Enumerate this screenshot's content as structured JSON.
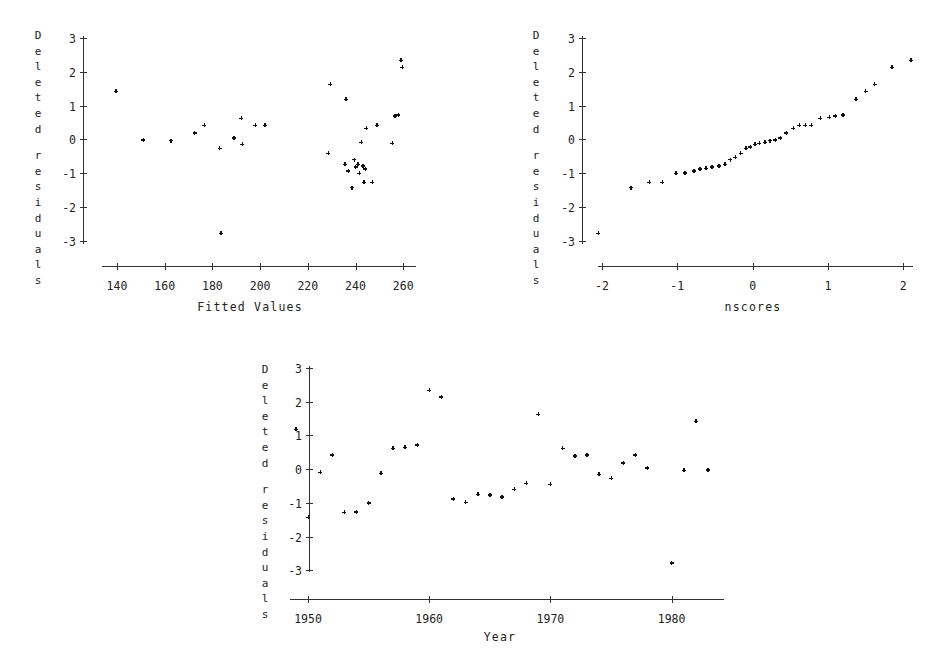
{
  "figure": {
    "title": "",
    "background": "#ffffff",
    "ink": "#111111"
  },
  "chart_data": [
    {
      "id": "fitted-values-plot",
      "type": "scatter",
      "title": "",
      "xlabel": "Fitted Values",
      "ylabel": "Deleted residuals",
      "ylabel_stacked": [
        "D",
        "e",
        "l",
        "e",
        "t",
        "e",
        "d",
        "",
        "r",
        "e",
        "s",
        "i",
        "d",
        "u",
        "a",
        "l",
        "s"
      ],
      "xlim": [
        130,
        268
      ],
      "ylim": [
        -3.4,
        3.2
      ],
      "xticks": [
        140,
        160,
        180,
        200,
        220,
        240,
        260
      ],
      "xticklabels": [
        "140",
        "160",
        "180",
        "200",
        "220",
        "240",
        "260"
      ],
      "yticks": [
        3,
        2,
        1,
        0,
        -1,
        -2,
        -3
      ],
      "yticklabels": [
        "3",
        "2",
        "1",
        "0",
        "-1",
        "-2",
        "-3"
      ],
      "grid": false,
      "legend": "none",
      "marker": "plus",
      "points": [
        [
          139.5,
          1.42
        ],
        [
          151.0,
          -0.02
        ],
        [
          162.5,
          -0.04
        ],
        [
          172.5,
          0.19
        ],
        [
          176.5,
          0.42
        ],
        [
          183.0,
          -0.27
        ],
        [
          183.5,
          -2.78
        ],
        [
          189.0,
          0.04
        ],
        [
          192.5,
          -0.15
        ],
        [
          192.0,
          0.62
        ],
        [
          198.0,
          0.42
        ],
        [
          202.0,
          0.41
        ],
        [
          229.5,
          1.63
        ],
        [
          228.5,
          -0.42
        ],
        [
          236.0,
          1.18
        ],
        [
          235.5,
          -0.74
        ],
        [
          237.0,
          -0.93
        ],
        [
          238.5,
          -1.43
        ],
        [
          239.5,
          -0.6
        ],
        [
          240.0,
          -0.82
        ],
        [
          241.0,
          -0.74
        ],
        [
          241.5,
          -1.0
        ],
        [
          242.5,
          -0.09
        ],
        [
          243.0,
          -0.79
        ],
        [
          243.5,
          -1.28
        ],
        [
          244.0,
          -0.88
        ],
        [
          244.5,
          0.32
        ],
        [
          247.0,
          -1.27
        ],
        [
          249.0,
          0.42
        ],
        [
          255.5,
          -0.12
        ],
        [
          256.5,
          0.69
        ],
        [
          258.0,
          0.72
        ],
        [
          259.0,
          2.34
        ],
        [
          259.5,
          2.14
        ]
      ]
    },
    {
      "id": "nscores-plot",
      "type": "scatter",
      "title": "",
      "xlabel": "nscores",
      "ylabel": "Deleted residuals",
      "ylabel_stacked": [
        "D",
        "e",
        "l",
        "e",
        "t",
        "e",
        "d",
        "",
        "r",
        "e",
        "s",
        "i",
        "d",
        "u",
        "a",
        "l",
        "s"
      ],
      "xlim": [
        -2.25,
        2.3
      ],
      "ylim": [
        -3.4,
        3.2
      ],
      "xticks": [
        -2,
        -1,
        0,
        1,
        2
      ],
      "xticklabels": [
        "-2",
        "-1",
        "0",
        "1",
        "2"
      ],
      "yticks": [
        3,
        2,
        1,
        0,
        -1,
        -2,
        -3
      ],
      "yticklabels": [
        "3",
        "2",
        "1",
        "0",
        "-1",
        "-2",
        "-3"
      ],
      "grid": false,
      "legend": "none",
      "marker": "plus",
      "points": [
        [
          -2.05,
          -2.78
        ],
        [
          -1.62,
          -1.43
        ],
        [
          -1.37,
          -1.28
        ],
        [
          -1.2,
          -1.27
        ],
        [
          -1.02,
          -1.0
        ],
        [
          -0.9,
          -0.99
        ],
        [
          -0.78,
          -0.93
        ],
        [
          -0.7,
          -0.88
        ],
        [
          -0.62,
          -0.86
        ],
        [
          -0.54,
          -0.82
        ],
        [
          -0.45,
          -0.79
        ],
        [
          -0.37,
          -0.74
        ],
        [
          -0.3,
          -0.6
        ],
        [
          -0.23,
          -0.54
        ],
        [
          -0.16,
          -0.42
        ],
        [
          -0.09,
          -0.27
        ],
        [
          -0.03,
          -0.22
        ],
        [
          0.03,
          -0.15
        ],
        [
          0.09,
          -0.12
        ],
        [
          0.16,
          -0.09
        ],
        [
          0.23,
          -0.04
        ],
        [
          0.3,
          -0.02
        ],
        [
          0.37,
          0.04
        ],
        [
          0.45,
          0.19
        ],
        [
          0.54,
          0.32
        ],
        [
          0.62,
          0.41
        ],
        [
          0.7,
          0.42
        ],
        [
          0.78,
          0.42
        ],
        [
          0.9,
          0.62
        ],
        [
          1.02,
          0.65
        ],
        [
          1.1,
          0.69
        ],
        [
          1.2,
          0.72
        ],
        [
          1.37,
          1.18
        ],
        [
          1.5,
          1.42
        ],
        [
          1.62,
          1.63
        ],
        [
          1.85,
          2.14
        ],
        [
          2.1,
          2.34
        ]
      ]
    },
    {
      "id": "year-plot",
      "type": "scatter",
      "title": "",
      "xlabel": "Year",
      "ylabel": "Deleted residuals",
      "ylabel_stacked": [
        "D",
        "e",
        "l",
        "e",
        "t",
        "e",
        "d",
        "",
        "r",
        "e",
        "s",
        "i",
        "d",
        "u",
        "a",
        "l",
        "s"
      ],
      "xlim": [
        1948.2,
        1984.5
      ],
      "ylim": [
        -3.4,
        3.2
      ],
      "xticks": [
        1950,
        1960,
        1970,
        1980
      ],
      "xticklabels": [
        "1950",
        "1960",
        "1970",
        "1980"
      ],
      "yticks": [
        3,
        2,
        1,
        0,
        -1,
        -2,
        -3
      ],
      "yticklabels": [
        "3",
        "2",
        "1",
        "0",
        "-1",
        "-2",
        "-3"
      ],
      "grid": false,
      "legend": "none",
      "marker": "plus",
      "points": [
        [
          1949.0,
          1.18
        ],
        [
          1950.0,
          -1.43
        ],
        [
          1951.0,
          -0.09
        ],
        [
          1952.0,
          0.42
        ],
        [
          1953.0,
          -1.28
        ],
        [
          1954.0,
          -1.27
        ],
        [
          1955.0,
          -1.0
        ],
        [
          1956.0,
          -0.12
        ],
        [
          1957.0,
          0.62
        ],
        [
          1958.0,
          0.65
        ],
        [
          1959.0,
          0.72
        ],
        [
          1960.0,
          2.34
        ],
        [
          1961.0,
          2.14
        ],
        [
          1962.0,
          -0.88
        ],
        [
          1963.0,
          -0.99
        ],
        [
          1964.0,
          -0.74
        ],
        [
          1965.0,
          -0.76
        ],
        [
          1966.0,
          -0.82
        ],
        [
          1967.0,
          -0.6
        ],
        [
          1968.0,
          -0.42
        ],
        [
          1969.0,
          1.63
        ],
        [
          1970.0,
          -0.45
        ],
        [
          1971.0,
          0.62
        ],
        [
          1972.0,
          0.39
        ],
        [
          1973.0,
          0.42
        ],
        [
          1974.0,
          -0.15
        ],
        [
          1975.0,
          -0.27
        ],
        [
          1976.0,
          0.19
        ],
        [
          1977.0,
          0.42
        ],
        [
          1978.0,
          0.04
        ],
        [
          1980.0,
          -2.78
        ],
        [
          1981.0,
          -0.04
        ],
        [
          1982.0,
          1.42
        ],
        [
          1983.0,
          -0.02
        ]
      ]
    }
  ]
}
